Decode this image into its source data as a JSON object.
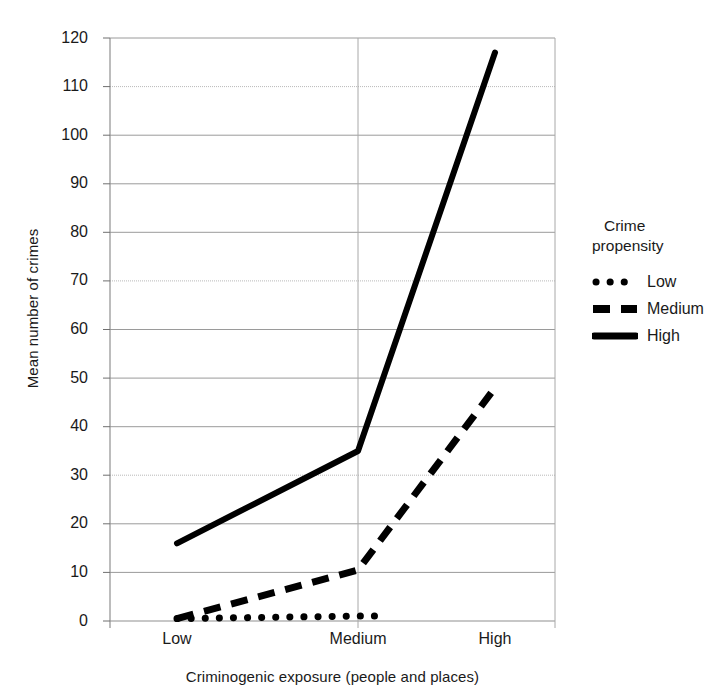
{
  "chart_data": {
    "type": "line",
    "title": "",
    "xlabel": "Criminogenic exposure (people and places)",
    "ylabel": "Mean number of crimes",
    "categories": [
      "Low",
      "Medium",
      "High"
    ],
    "xtick_labels": [
      "Low",
      "Medium",
      "High"
    ],
    "ytick_labels": [
      "0",
      "10",
      "20",
      "30",
      "40",
      "50",
      "60",
      "70",
      "80",
      "90",
      "100",
      "110",
      "120"
    ],
    "yticks": [
      0,
      10,
      20,
      30,
      40,
      50,
      60,
      70,
      80,
      90,
      100,
      110,
      120
    ],
    "ylim": [
      0,
      120
    ],
    "grid": "horizontal-and-vertical",
    "legend_position": "right",
    "legend_title": "Crime\npropensity",
    "series": [
      {
        "name": "Low",
        "style": "dotted",
        "color": "#000000",
        "values": [
          0.5,
          1.0,
          null
        ]
      },
      {
        "name": "Medium",
        "style": "dashed",
        "color": "#000000",
        "values": [
          0.5,
          10.5,
          48
        ]
      },
      {
        "name": "High",
        "style": "solid",
        "color": "#000000",
        "values": [
          16,
          35,
          117
        ]
      }
    ]
  },
  "legend": {
    "title_line1": "Crime",
    "title_line2": "propensity",
    "items": [
      {
        "label": "Low",
        "swatch": "dotted-line-icon"
      },
      {
        "label": "Medium",
        "swatch": "dashed-line-icon"
      },
      {
        "label": "High",
        "swatch": "solid-line-icon"
      }
    ]
  },
  "axes": {
    "y_title": "Mean number of crimes",
    "x_title": "Criminogenic exposure (people and places)",
    "y_ticks": [
      "120",
      "110",
      "100",
      "90",
      "80",
      "70",
      "60",
      "50",
      "40",
      "30",
      "20",
      "10",
      "0"
    ],
    "x_ticks": [
      "Low",
      "Medium",
      "High"
    ]
  }
}
